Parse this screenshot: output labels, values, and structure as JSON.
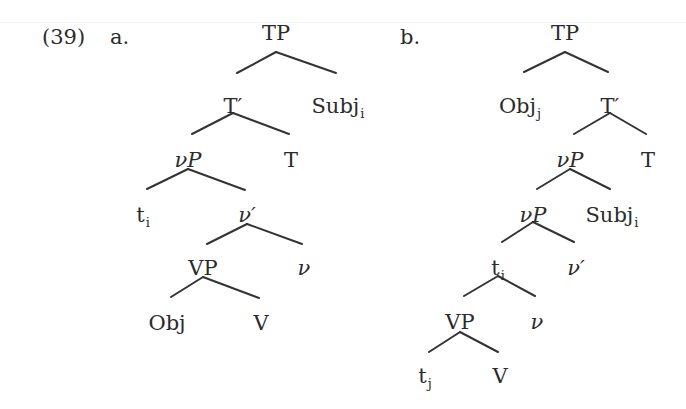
{
  "example": {
    "number": "(39)",
    "trees": [
      {
        "id": "a",
        "label": "a.",
        "nodes": [
          {
            "id": "TP",
            "text": "TP"
          },
          {
            "id": "Tbar",
            "text": "T′"
          },
          {
            "id": "Subj",
            "text": "Subj",
            "sub": "i"
          },
          {
            "id": "vP",
            "text": "νP"
          },
          {
            "id": "T",
            "text": "T"
          },
          {
            "id": "ti",
            "text": "t",
            "sub": "i"
          },
          {
            "id": "vbar",
            "text": "ν′"
          },
          {
            "id": "VP",
            "text": "VP"
          },
          {
            "id": "v",
            "text": "ν"
          },
          {
            "id": "Obj",
            "text": "Obj"
          },
          {
            "id": "V",
            "text": "V"
          }
        ],
        "edges": [
          [
            "TP",
            "Tbar"
          ],
          [
            "TP",
            "Subj"
          ],
          [
            "Tbar",
            "vP"
          ],
          [
            "Tbar",
            "T"
          ],
          [
            "vP",
            "ti"
          ],
          [
            "vP",
            "vbar"
          ],
          [
            "vbar",
            "VP"
          ],
          [
            "vbar",
            "v"
          ],
          [
            "VP",
            "Obj"
          ],
          [
            "VP",
            "V"
          ]
        ]
      },
      {
        "id": "b",
        "label": "b.",
        "nodes": [
          {
            "id": "TP",
            "text": "TP"
          },
          {
            "id": "Obj",
            "text": "Obj",
            "sub": "j"
          },
          {
            "id": "Tbar",
            "text": "T′"
          },
          {
            "id": "vP1",
            "text": "νP"
          },
          {
            "id": "T",
            "text": "T"
          },
          {
            "id": "vP2",
            "text": "νP"
          },
          {
            "id": "Subj",
            "text": "Subj",
            "sub": "i"
          },
          {
            "id": "ti",
            "text": "t",
            "sub": "i"
          },
          {
            "id": "vbar",
            "text": "ν′"
          },
          {
            "id": "VP",
            "text": "VP"
          },
          {
            "id": "v",
            "text": "ν"
          },
          {
            "id": "tj",
            "text": "t",
            "sub": "j"
          },
          {
            "id": "V",
            "text": "V"
          }
        ],
        "edges": [
          [
            "TP",
            "Obj"
          ],
          [
            "TP",
            "Tbar"
          ],
          [
            "Tbar",
            "vP1"
          ],
          [
            "Tbar",
            "T"
          ],
          [
            "vP1",
            "vP2"
          ],
          [
            "vP1",
            "Subj"
          ],
          [
            "vP2",
            "ti"
          ],
          [
            "vP2",
            "vbar"
          ],
          [
            "ti",
            "VP"
          ],
          [
            "ti",
            "v"
          ],
          [
            "VP",
            "tj"
          ],
          [
            "VP",
            "V"
          ]
        ]
      }
    ]
  }
}
